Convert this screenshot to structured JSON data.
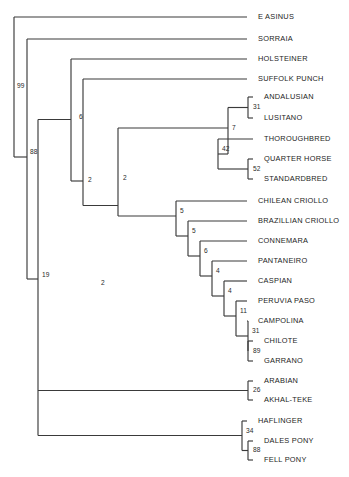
{
  "figure": {
    "type": "phylogenetic-tree",
    "title": "",
    "width": 349,
    "height": 477,
    "background_color": "#ffffff",
    "branch_color": "#3a3a3a",
    "text_color": "#1d1d1d"
  },
  "chart_data": {
    "type": "tree",
    "title": "",
    "xlabel": "",
    "ylabel": "",
    "layout": "rectangular-cladogram",
    "node_label_meaning": "bootstrap support value",
    "taxa": [
      {
        "id": "t0",
        "label": "E ASINUS",
        "x": 247,
        "y": 17
      },
      {
        "id": "t1",
        "label": "SORRAIA",
        "x": 247,
        "y": 39
      },
      {
        "id": "t2",
        "label": "HOLSTEINER",
        "x": 247,
        "y": 59
      },
      {
        "id": "t3",
        "label": "SUFFOLK PUNCH",
        "x": 247,
        "y": 79
      },
      {
        "id": "t4",
        "label": "ANDALUSIAN",
        "x": 253,
        "y": 97
      },
      {
        "id": "t5",
        "label": "LUSITANO",
        "x": 253,
        "y": 118
      },
      {
        "id": "t6",
        "label": "THOROUGHBRED",
        "x": 253,
        "y": 139
      },
      {
        "id": "t7",
        "label": "QUARTER HORSE",
        "x": 253,
        "y": 159
      },
      {
        "id": "t8",
        "label": "STANDARDBRED",
        "x": 253,
        "y": 179
      },
      {
        "id": "t9",
        "label": "CHILEAN CRIOLLO",
        "x": 247,
        "y": 201
      },
      {
        "id": "t10",
        "label": "BRAZILLIAN CRIOLLO",
        "x": 247,
        "y": 221
      },
      {
        "id": "t11",
        "label": "CONNEMARA",
        "x": 247,
        "y": 241
      },
      {
        "id": "t12",
        "label": "PANTANEIRO",
        "x": 247,
        "y": 261
      },
      {
        "id": "t13",
        "label": "CASPIAN",
        "x": 247,
        "y": 281
      },
      {
        "id": "t14",
        "label": "PERUVIA PASO",
        "x": 247,
        "y": 301
      },
      {
        "id": "t15",
        "label": "CAMPOLINA",
        "x": 247,
        "y": 321
      },
      {
        "id": "t16",
        "label": "CHILOTE",
        "x": 253,
        "y": 341
      },
      {
        "id": "t17",
        "label": "GARRANO",
        "x": 253,
        "y": 361
      },
      {
        "id": "t18",
        "label": "ARABIAN",
        "x": 253,
        "y": 381
      },
      {
        "id": "t19",
        "label": "AKHAL-TEKE",
        "x": 253,
        "y": 400
      },
      {
        "id": "t20",
        "label": "HAFLINGER",
        "x": 247,
        "y": 421
      },
      {
        "id": "t21",
        "label": "DALES PONY",
        "x": 253,
        "y": 441
      },
      {
        "id": "t22",
        "label": "FELL PONY",
        "x": 253,
        "y": 460
      }
    ],
    "support_values": [
      {
        "id": "n99",
        "label": "99",
        "x": 17,
        "y": 86
      },
      {
        "id": "n88",
        "label": "88",
        "x": 30,
        "y": 152
      },
      {
        "id": "n19",
        "label": "19",
        "x": 42,
        "y": 275
      },
      {
        "id": "n6",
        "label": "6",
        "x": 79,
        "y": 117
      },
      {
        "id": "n2a",
        "label": "2",
        "x": 88,
        "y": 180
      },
      {
        "id": "n2b",
        "label": "2",
        "x": 123,
        "y": 178
      },
      {
        "id": "n7",
        "label": "7",
        "x": 232,
        "y": 128
      },
      {
        "id": "n31a",
        "label": "31",
        "x": 253,
        "y": 107
      },
      {
        "id": "n42",
        "label": "42",
        "x": 222,
        "y": 149
      },
      {
        "id": "n52",
        "label": "52",
        "x": 253,
        "y": 169
      },
      {
        "id": "n2c",
        "label": "2",
        "x": 101,
        "y": 283
      },
      {
        "id": "n5a",
        "label": "5",
        "x": 180,
        "y": 211
      },
      {
        "id": "n5b",
        "label": "5",
        "x": 192,
        "y": 231
      },
      {
        "id": "n6b",
        "label": "6",
        "x": 204,
        "y": 251
      },
      {
        "id": "n4a",
        "label": "4",
        "x": 216,
        "y": 271
      },
      {
        "id": "n4b",
        "label": "4",
        "x": 228,
        "y": 291
      },
      {
        "id": "n11",
        "label": "11",
        "x": 240,
        "y": 311
      },
      {
        "id": "n31b",
        "label": "31",
        "x": 252,
        "y": 331
      },
      {
        "id": "n89",
        "label": "89",
        "x": 253,
        "y": 351
      },
      {
        "id": "n26",
        "label": "26",
        "x": 253,
        "y": 390
      },
      {
        "id": "n34",
        "label": "34",
        "x": 246,
        "y": 431
      },
      {
        "id": "n88b",
        "label": "88",
        "x": 253,
        "y": 450
      }
    ],
    "internal_nodes": [
      {
        "id": "root",
        "x": 14,
        "y_top": 17,
        "y_bottom": 152,
        "support": "99"
      },
      {
        "id": "n88",
        "x": 27,
        "y_top": 39,
        "y_bottom": 275,
        "support": "88"
      },
      {
        "id": "n19",
        "x": 38,
        "y_top": 117,
        "y_bottom": 441,
        "support": "19"
      },
      {
        "id": "n6",
        "x": 71,
        "y_top": 59,
        "y_bottom": 180,
        "support": "6"
      },
      {
        "id": "n2a",
        "x": 83,
        "y_top": 79,
        "y_bottom": 283,
        "support": "2"
      },
      {
        "id": "n2b",
        "x": 118,
        "y_top": 128,
        "y_bottom": 283,
        "support": "2"
      },
      {
        "id": "n7",
        "x": 228,
        "y_top": 107,
        "y_bottom": 149,
        "support": "7"
      },
      {
        "id": "n31a",
        "x": 248,
        "y_top": 97,
        "y_bottom": 118,
        "support": "31"
      },
      {
        "id": "n42",
        "x": 218,
        "y_top": 139,
        "y_bottom": 169,
        "support": "42"
      },
      {
        "id": "n52",
        "x": 248,
        "y_top": 159,
        "y_bottom": 179,
        "support": "52"
      },
      {
        "id": "n5a",
        "x": 176,
        "y_top": 201,
        "y_bottom": 231,
        "support": "5"
      },
      {
        "id": "n5b",
        "x": 188,
        "y_top": 221,
        "y_bottom": 251,
        "support": "5"
      },
      {
        "id": "n6b",
        "x": 200,
        "y_top": 241,
        "y_bottom": 271,
        "support": "6"
      },
      {
        "id": "n4a",
        "x": 212,
        "y_top": 261,
        "y_bottom": 291,
        "support": "4"
      },
      {
        "id": "n4b",
        "x": 224,
        "y_top": 281,
        "y_bottom": 311,
        "support": "4"
      },
      {
        "id": "n11",
        "x": 236,
        "y_top": 301,
        "y_bottom": 331,
        "support": "11"
      },
      {
        "id": "n31b",
        "x": 248,
        "y_top": 321,
        "y_bottom": 351,
        "support": "31"
      },
      {
        "id": "n89",
        "x": 248,
        "y_top": 341,
        "y_bottom": 361,
        "support": "89"
      },
      {
        "id": "n26",
        "x": 248,
        "y_top": 381,
        "y_bottom": 400,
        "support": "26"
      },
      {
        "id": "n34",
        "x": 242,
        "y_top": 421,
        "y_bottom": 450,
        "support": "34"
      },
      {
        "id": "n88b",
        "x": 248,
        "y_top": 441,
        "y_bottom": 460,
        "support": "88"
      }
    ]
  }
}
